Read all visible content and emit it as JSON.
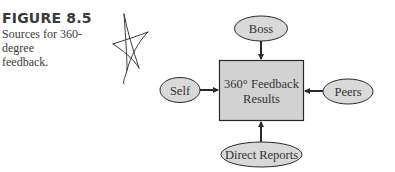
{
  "figure": {
    "label": "FIGURE 8.5",
    "caption_line1": "Sources for 360-",
    "caption_line2": "degree feedback."
  },
  "diagram": {
    "center": {
      "line1": "360° Feedback",
      "line2": "Results"
    },
    "sources": {
      "top": "Boss",
      "left": "Self",
      "right": "Peers",
      "bottom": "Direct Reports"
    },
    "colors": {
      "box_fill": "#d2d2d2",
      "ellipse_fill": "#d9d9d9",
      "stroke": "#2a2a2a",
      "text": "#333333"
    }
  }
}
